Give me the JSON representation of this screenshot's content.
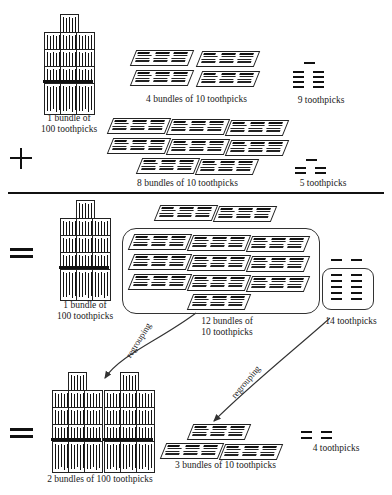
{
  "diagram": {
    "operators": {
      "plus": "+",
      "equals_1": "=",
      "equals_2": "="
    },
    "rows": {
      "addend_1": {
        "hundreds": {
          "count": 1,
          "label": "1 bundle of\n100 toothpicks"
        },
        "tens": {
          "count": 4,
          "label": "4 bundles of 10 toothpicks"
        },
        "ones": {
          "count": 9,
          "label": "9 toothpicks"
        }
      },
      "addend_2": {
        "hundreds": {
          "count": 0,
          "label": ""
        },
        "tens": {
          "count": 8,
          "label": "8 bundles of 10 toothpicks"
        },
        "ones": {
          "count": 5,
          "label": "5 toothpicks"
        }
      },
      "sum_unregrouped": {
        "hundreds": {
          "count": 1,
          "label": "1 bundle of\n100 toothpicks"
        },
        "tens": {
          "count": 12,
          "label": "12 bundles of\n10 toothpicks"
        },
        "ones": {
          "count": 14,
          "label": "14 toothpicks"
        }
      },
      "sum_regrouped": {
        "hundreds": {
          "count": 2,
          "label": "2 bundles of 100 toothpicks"
        },
        "tens": {
          "count": 3,
          "label": "3 bundles of 10 toothpicks"
        },
        "ones": {
          "count": 4,
          "label": "4 toothpicks"
        }
      }
    },
    "annotations": {
      "regroup_tens_to_hundred": "regrouping",
      "regroup_ones_to_ten": "regrouping"
    },
    "colors": {
      "ink": "#111111",
      "paper": "#ffffff",
      "outline": "#222222"
    }
  }
}
